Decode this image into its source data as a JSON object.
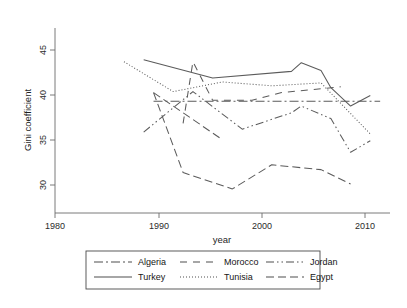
{
  "chart_data": {
    "type": "line",
    "title": "",
    "xlabel": "year",
    "ylabel": "Gini coefficient",
    "xlim": [
      1978,
      2012
    ],
    "ylim": [
      27.6,
      46.8
    ],
    "xticks": [
      1980,
      1990,
      2000,
      2010
    ],
    "xtick_labels": [
      "1980",
      "1990",
      "2000",
      "2010"
    ],
    "yticks": [
      30,
      35,
      40,
      45
    ],
    "ytick_labels": [
      "30",
      "35",
      "40",
      "45"
    ],
    "grid": false,
    "legend_position": "bottom",
    "legend_columns": 3,
    "series": [
      {
        "name": "Algeria",
        "style": "dash-dot",
        "x": [
          1988,
          1995,
          2011
        ],
        "y": [
          39.2,
          39.2,
          39.2
        ]
      },
      {
        "name": "Turkey",
        "style": "solid",
        "x": [
          1987,
          1994,
          2002,
          2003,
          2005,
          2006,
          2008,
          2010
        ],
        "y": [
          43.5,
          41.6,
          42.3,
          43.2,
          42.4,
          40.6,
          38.7,
          39.8
        ]
      },
      {
        "name": "Morocco",
        "style": "dashed-wide",
        "x": [
          1991,
          1992,
          1994,
          1998,
          2001,
          2007
        ],
        "y": [
          36.9,
          43.3,
          39.3,
          39.3,
          40.1,
          40.7
        ]
      },
      {
        "name": "Tunisia",
        "style": "dotted",
        "x": [
          1985,
          1990,
          1995,
          2000,
          2005,
          2010
        ],
        "y": [
          43.3,
          40.2,
          41.2,
          40.8,
          41.1,
          35.8
        ]
      },
      {
        "name": "Jordan",
        "style": "dash-dot-dot",
        "x": [
          1987,
          1992,
          1997,
          2002,
          2003,
          2006,
          2008,
          2010
        ],
        "y": [
          36.0,
          40.2,
          36.3,
          38.0,
          38.7,
          37.4,
          33.9,
          35.1
        ]
      },
      {
        "name": "Egypt",
        "style": "dashed-long",
        "x": [
          1988,
          1991,
          1996,
          2000,
          2005,
          2008
        ],
        "y": [
          40.1,
          31.8,
          30.1,
          32.6,
          32.1,
          30.6
        ]
      }
    ],
    "egypt_upper_segment": {
      "name": "Egypt",
      "x": [
        1988,
        1995
      ],
      "y": [
        40.1,
        35.2
      ]
    }
  },
  "legend": {
    "rows": [
      [
        {
          "label": "Algeria",
          "style": "dash-dot"
        },
        {
          "label": "Morocco",
          "style": "dashed-wide"
        },
        {
          "label": "Jordan",
          "style": "dash-dot-dot"
        }
      ],
      [
        {
          "label": "Turkey",
          "style": "solid"
        },
        {
          "label": "Tunisia",
          "style": "dotted"
        },
        {
          "label": "Egypt",
          "style": "dashed-long"
        }
      ]
    ]
  },
  "colors": {
    "background": "#ffffff",
    "axis": "#6b6b6b",
    "line": "#5b5b5b",
    "text": "#1a1a1a",
    "legend_border": "#4a4a4a"
  }
}
